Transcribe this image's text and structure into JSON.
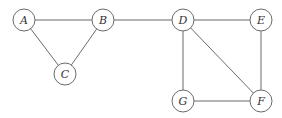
{
  "diagram": {
    "type": "undirected-graph",
    "nodes": [
      {
        "id": "A",
        "label": "A",
        "x": 24,
        "y": 20
      },
      {
        "id": "B",
        "label": "B",
        "x": 103,
        "y": 20
      },
      {
        "id": "C",
        "label": "C",
        "x": 65,
        "y": 74
      },
      {
        "id": "D",
        "label": "D",
        "x": 183,
        "y": 20
      },
      {
        "id": "E",
        "label": "E",
        "x": 261,
        "y": 20
      },
      {
        "id": "F",
        "label": "F",
        "x": 261,
        "y": 101
      },
      {
        "id": "G",
        "label": "G",
        "x": 183,
        "y": 101
      }
    ],
    "edges": [
      [
        "A",
        "B"
      ],
      [
        "A",
        "C"
      ],
      [
        "B",
        "C"
      ],
      [
        "B",
        "D"
      ],
      [
        "D",
        "E"
      ],
      [
        "D",
        "G"
      ],
      [
        "D",
        "F"
      ],
      [
        "E",
        "F"
      ],
      [
        "G",
        "F"
      ]
    ],
    "node_radius": 11,
    "colors": {
      "stroke": "#6b6b6b",
      "text": "#333333",
      "background": "#ffffff"
    }
  }
}
